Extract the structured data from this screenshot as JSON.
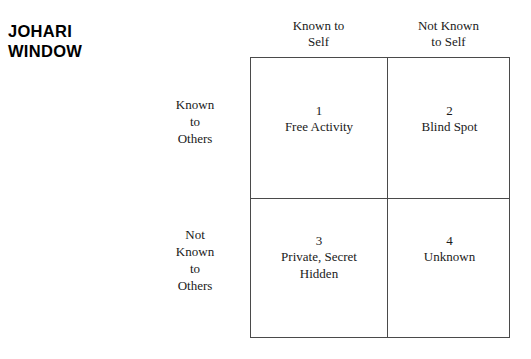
{
  "title": {
    "lines": [
      "JOHARI",
      "WINDOW"
    ]
  },
  "columns": [
    {
      "lines": [
        "Known to",
        "Self"
      ]
    },
    {
      "lines": [
        "Not Known",
        "to Self"
      ]
    }
  ],
  "rows": [
    {
      "lines": [
        "Known",
        "to",
        "Others"
      ]
    },
    {
      "lines": [
        "Not",
        "Known",
        "to",
        "Others"
      ]
    }
  ],
  "quadrants": [
    {
      "number": "1",
      "lines": [
        "Free Activity"
      ]
    },
    {
      "number": "2",
      "lines": [
        "Blind Spot"
      ]
    },
    {
      "number": "3",
      "lines": [
        "Private, Secret",
        "Hidden"
      ]
    },
    {
      "number": "4",
      "lines": [
        "Unknown"
      ]
    }
  ],
  "colors": {
    "background": "#ffffff",
    "line": "#4a4a4a",
    "text": "#1a1a1a",
    "title_text": "#000000"
  }
}
